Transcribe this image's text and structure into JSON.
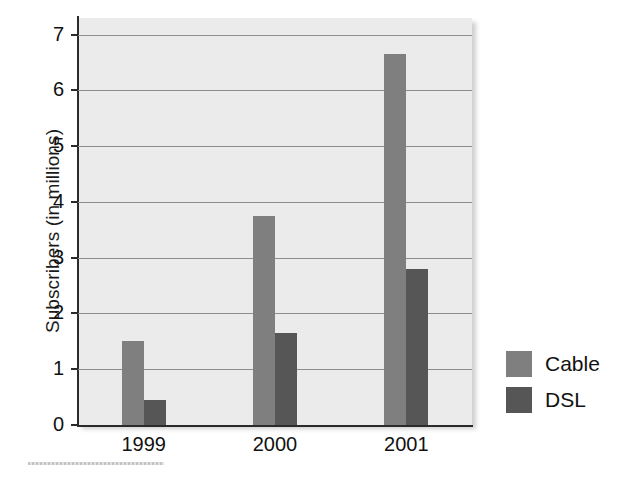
{
  "chart_data": {
    "type": "bar",
    "title": "",
    "xlabel": "",
    "ylabel": "Subscribers (in millions)",
    "categories": [
      "1999",
      "2000",
      "2001"
    ],
    "series": [
      {
        "name": "Cable",
        "color": "#7f7f7f",
        "values": [
          1.5,
          3.75,
          6.65
        ]
      },
      {
        "name": "DSL",
        "color": "#565656",
        "values": [
          0.45,
          1.65,
          2.8
        ]
      }
    ],
    "ylim": [
      0,
      7.3
    ],
    "yticks": [
      0,
      1,
      2,
      3,
      4,
      5,
      6,
      7
    ],
    "ytick_labels": [
      "0",
      "1",
      "2",
      "3",
      "4",
      "5",
      "6",
      "7"
    ],
    "grid": true,
    "legend_position": "right",
    "plot_background": "#ebebeb",
    "figure_background": "#ffffff"
  },
  "legend": {
    "items": [
      {
        "label": "Cable",
        "color": "#7f7f7f"
      },
      {
        "label": "DSL",
        "color": "#565656"
      }
    ]
  }
}
